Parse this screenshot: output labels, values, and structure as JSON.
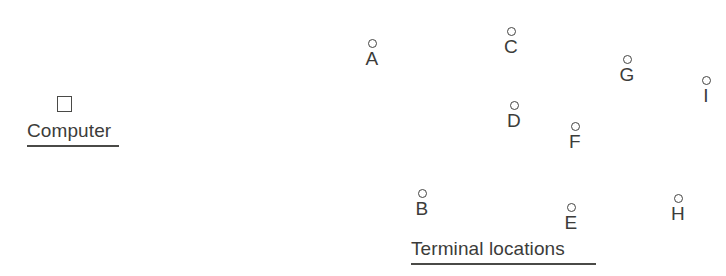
{
  "figure": {
    "width": 726,
    "height": 276,
    "background": "#ffffff",
    "ink_color": "#3c3c3a",
    "computer": {
      "marker_shape": "square",
      "marker": {
        "x": 57,
        "y": 96
      },
      "caption": "Computer",
      "caption_position": {
        "x": 27,
        "y": 120
      },
      "underline_width": 92
    },
    "terminals": {
      "marker_shape": "circle",
      "caption": "Terminal locations",
      "caption_position": {
        "x": 411,
        "y": 238
      },
      "underline_width": 185,
      "points": [
        {
          "label": "A",
          "x": 372,
          "y": 43
        },
        {
          "label": "B",
          "x": 422,
          "y": 193
        },
        {
          "label": "C",
          "x": 511,
          "y": 31
        },
        {
          "label": "D",
          "x": 514,
          "y": 105
        },
        {
          "label": "E",
          "x": 571,
          "y": 207
        },
        {
          "label": "F",
          "x": 575,
          "y": 126
        },
        {
          "label": "G",
          "x": 627,
          "y": 59
        },
        {
          "label": "H",
          "x": 678,
          "y": 198
        },
        {
          "label": "I",
          "x": 706,
          "y": 80
        }
      ]
    }
  }
}
